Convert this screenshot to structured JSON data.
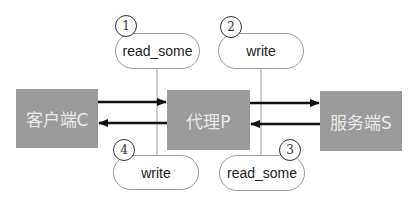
{
  "nodes": {
    "client": "客户端C",
    "proxy": "代理P",
    "server": "服务端S"
  },
  "steps": [
    {
      "number": "1",
      "label": "read_some"
    },
    {
      "number": "2",
      "label": "write"
    },
    {
      "number": "3",
      "label": "read_some"
    },
    {
      "number": "4",
      "label": "write"
    }
  ],
  "colors": {
    "node_fill": "#9b9b9b",
    "node_text": "#e8e8e8",
    "arrow": "#111111",
    "connector": "#9a9a9a"
  }
}
